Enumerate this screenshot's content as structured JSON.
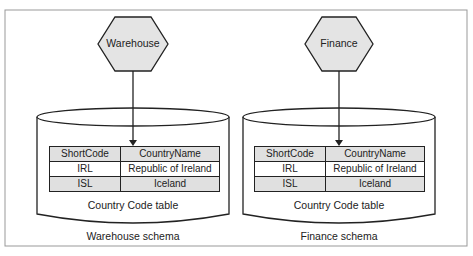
{
  "diagram": {
    "schemas": [
      {
        "name": "Warehouse",
        "schema_label": "Warehouse schema",
        "table_caption": "Country Code table",
        "table": {
          "headers": [
            "ShortCode",
            "CountryName"
          ],
          "rows": [
            [
              "IRL",
              "Republic of Ireland"
            ],
            [
              "ISL",
              "Iceland"
            ]
          ]
        }
      },
      {
        "name": "Finance",
        "schema_label": "Finance schema",
        "table_caption": "Country Code table",
        "table": {
          "headers": [
            "ShortCode",
            "CountryName"
          ],
          "rows": [
            [
              "IRL",
              "Republic of Ireland"
            ],
            [
              "ISL",
              "Iceland"
            ]
          ]
        }
      }
    ],
    "colors": {
      "hexagon_fill": "#e4e4e4",
      "row_shade": "#e0e0e0",
      "stroke": "#222222",
      "frame": "#999999"
    }
  }
}
